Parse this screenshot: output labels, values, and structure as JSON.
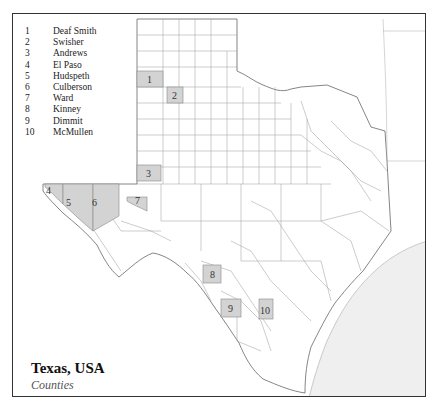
{
  "map": {
    "title": "Texas, USA",
    "subtitle": "Counties",
    "highlight_color": "#d3d3d3",
    "gulf_color": "#efefef",
    "border_color": "#333333",
    "county_line_color": "#888888"
  },
  "legend": {
    "items": [
      {
        "num": "1",
        "name": "Deaf Smith"
      },
      {
        "num": "2",
        "name": "Swisher"
      },
      {
        "num": "3",
        "name": "Andrews"
      },
      {
        "num": "4",
        "name": "El Paso"
      },
      {
        "num": "5",
        "name": "Hudspeth"
      },
      {
        "num": "6",
        "name": "Culberson"
      },
      {
        "num": "7",
        "name": "Ward"
      },
      {
        "num": "8",
        "name": "Kinney"
      },
      {
        "num": "9",
        "name": "Dimmit"
      },
      {
        "num": "10",
        "name": "McMullen"
      }
    ]
  },
  "labels": {
    "c1": "1",
    "c2": "2",
    "c3": "3",
    "c4": "4",
    "c5": "5",
    "c6": "6",
    "c7": "7",
    "c8": "8",
    "c9": "9",
    "c10": "10"
  }
}
